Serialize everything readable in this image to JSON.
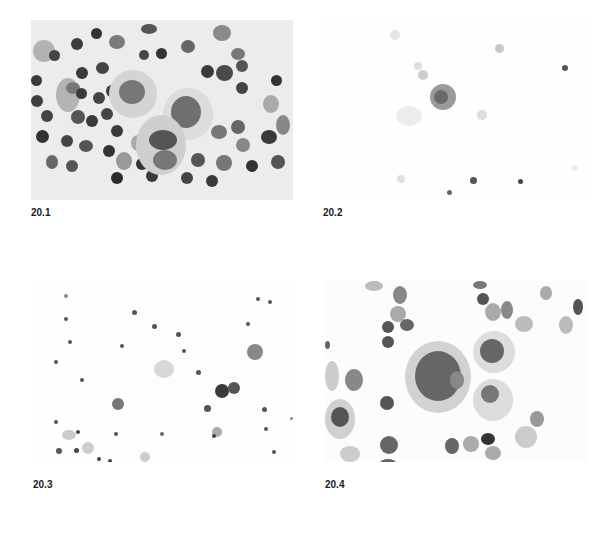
{
  "figure": {
    "panels": [
      {
        "id": "20.1",
        "label": "20.1",
        "description": "Dense smear with numerous small dark round lymphoid cells surrounding two large granular cells with large nuclei"
      },
      {
        "id": "20.2",
        "label": "20.2",
        "description": "Sparse field with a single granular cell and scattered small faint cells"
      },
      {
        "id": "20.3",
        "label": "20.3",
        "description": "Scattered small dark cells and several faintly granular cells, a dark binucleate pair right of center"
      },
      {
        "id": "20.4",
        "label": "20.4",
        "description": "Large cell with coarse dark cytoplasmic granules adjacent to two smaller granular cells, surrounded by round nucleated cells"
      }
    ]
  }
}
